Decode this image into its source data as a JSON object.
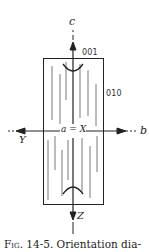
{
  "figure": {
    "axes": {
      "c": "c",
      "b": "b",
      "Y": "Y",
      "Z": "Z",
      "origin": "a = X"
    },
    "faces": {
      "top": "001",
      "side": "010"
    },
    "caption": {
      "fig_label": "Fig.",
      "number": "14-5.",
      "text": "Orientation dia-"
    }
  },
  "colors": {
    "ink": "#222222",
    "background": "#ffffff"
  }
}
